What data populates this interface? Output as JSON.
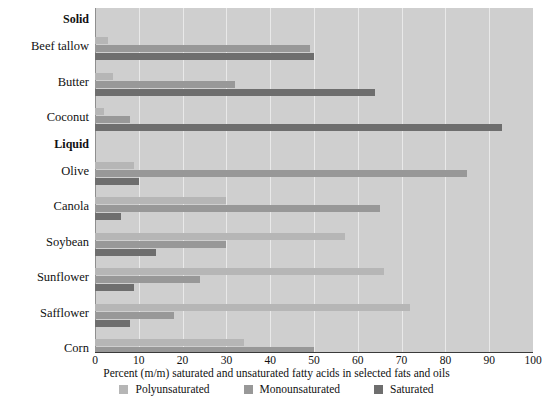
{
  "chart_data": {
    "type": "bar",
    "orientation": "horizontal",
    "title": "",
    "xlabel": "Percent (m/m) saturated and unsaturated fatty acids in selected fats and oils",
    "ylabel": "",
    "xlim": [
      0,
      100
    ],
    "xticks": [
      0,
      10,
      20,
      30,
      40,
      50,
      60,
      70,
      80,
      90,
      100
    ],
    "grid": true,
    "grid_axis": "x",
    "legend_position": "bottom-center",
    "group_headers": [
      "Solid",
      "Liquid"
    ],
    "categories": [
      "Beef tallow",
      "Butter",
      "Coconut",
      "Olive",
      "Canola",
      "Soybean",
      "Sunflower",
      "Safflower",
      "Corn"
    ],
    "series": [
      {
        "name": "Polyunsaturated",
        "color": "#b6b6b6",
        "values": [
          3,
          4,
          2,
          9,
          30,
          57,
          66,
          72,
          34
        ]
      },
      {
        "name": "Monounsaturated",
        "color": "#989898",
        "values": [
          49,
          32,
          8,
          85,
          65,
          30,
          24,
          18,
          50
        ]
      },
      {
        "name": "Saturated",
        "color": "#6e6e6e",
        "values": [
          50,
          64,
          93,
          10,
          6,
          14,
          9,
          8,
          15
        ]
      }
    ],
    "rows": [
      {
        "kind": "group",
        "label": "Solid"
      },
      {
        "kind": "category",
        "label": "Beef tallow",
        "poly": 3,
        "mono": 49,
        "sat": 50
      },
      {
        "kind": "category",
        "label": "Butter",
        "poly": 4,
        "mono": 32,
        "sat": 64
      },
      {
        "kind": "category",
        "label": "Coconut",
        "poly": 2,
        "mono": 8,
        "sat": 93
      },
      {
        "kind": "group",
        "label": "Liquid"
      },
      {
        "kind": "category",
        "label": "Olive",
        "poly": 9,
        "mono": 85,
        "sat": 10
      },
      {
        "kind": "category",
        "label": "Canola",
        "poly": 30,
        "mono": 65,
        "sat": 6
      },
      {
        "kind": "category",
        "label": "Soybean",
        "poly": 57,
        "mono": 30,
        "sat": 14
      },
      {
        "kind": "category",
        "label": "Sunflower",
        "poly": 66,
        "mono": 24,
        "sat": 9
      },
      {
        "kind": "category",
        "label": "Safflower",
        "poly": 72,
        "mono": 18,
        "sat": 8
      },
      {
        "kind": "category",
        "label": "Corn",
        "poly": 34,
        "mono": 50,
        "sat": 15
      }
    ],
    "legend": [
      {
        "label": "Polyunsaturated",
        "color": "#b6b6b6",
        "key": "poly"
      },
      {
        "label": "Monounsaturated",
        "color": "#989898",
        "key": "mono"
      },
      {
        "label": "Saturated",
        "color": "#6e6e6e",
        "key": "sat"
      }
    ],
    "colors": {
      "plot_background": "#cfcfcf",
      "gridline": "#e9e9e9",
      "axis_line": "#3a3a3a",
      "page_background": "#ffffff",
      "text": "#111111"
    }
  }
}
